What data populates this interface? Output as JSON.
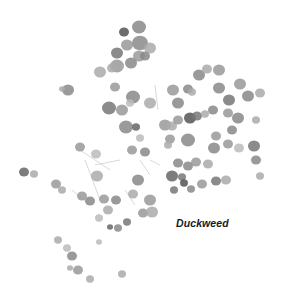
{
  "label": {
    "text": "Duckweed",
    "color": "#1a1a1a"
  },
  "background": "#ffffff",
  "fronds": [
    [
      139,
      27,
      7,
      "#888"
    ],
    [
      124,
      32,
      5,
      "#555"
    ],
    [
      140,
      43,
      8,
      "#8a8a8a"
    ],
    [
      127,
      45,
      6,
      "#999"
    ],
    [
      150,
      48,
      6,
      "#aaa"
    ],
    [
      117,
      53,
      6,
      "#777"
    ],
    [
      139,
      56,
      6,
      "#9a9a9a"
    ],
    [
      145,
      56,
      5,
      "#888"
    ],
    [
      117,
      66,
      7,
      "#999"
    ],
    [
      131,
      63,
      6,
      "#888"
    ],
    [
      100,
      72,
      6,
      "#aaa"
    ],
    [
      112,
      68,
      5,
      "#aaa"
    ],
    [
      68,
      90,
      6,
      "#888"
    ],
    [
      62,
      89,
      3,
      "#aaa"
    ],
    [
      115,
      87,
      5,
      "#999"
    ],
    [
      133,
      97,
      7,
      "#888"
    ],
    [
      109,
      108,
      7,
      "#777"
    ],
    [
      122,
      110,
      6,
      "#999"
    ],
    [
      150,
      103,
      6,
      "#aaa"
    ],
    [
      130,
      103,
      4,
      "#bbb"
    ],
    [
      126,
      127,
      7,
      "#888"
    ],
    [
      136,
      127,
      4,
      "#666"
    ],
    [
      165,
      125,
      6,
      "#999"
    ],
    [
      172,
      126,
      5,
      "#aaa"
    ],
    [
      140,
      138,
      4,
      "#bbb"
    ],
    [
      173,
      90,
      6,
      "#999"
    ],
    [
      188,
      89,
      5,
      "#888"
    ],
    [
      192,
      92,
      4,
      "#aaa"
    ],
    [
      178,
      103,
      6,
      "#888"
    ],
    [
      190,
      118,
      6,
      "#555"
    ],
    [
      197,
      116,
      5,
      "#777"
    ],
    [
      178,
      120,
      5,
      "#999"
    ],
    [
      205,
      114,
      4,
      "#aaa"
    ],
    [
      188,
      140,
      7,
      "#888"
    ],
    [
      170,
      139,
      5,
      "#999"
    ],
    [
      199,
      75,
      6,
      "#888"
    ],
    [
      219,
      70,
      6,
      "#999"
    ],
    [
      207,
      69,
      5,
      "#aaa"
    ],
    [
      219,
      88,
      6,
      "#888"
    ],
    [
      229,
      100,
      6,
      "#777"
    ],
    [
      240,
      84,
      6,
      "#999"
    ],
    [
      248,
      96,
      6,
      "#888"
    ],
    [
      260,
      93,
      5,
      "#aaa"
    ],
    [
      213,
      110,
      5,
      "#888"
    ],
    [
      228,
      113,
      5,
      "#999"
    ],
    [
      238,
      118,
      6,
      "#888"
    ],
    [
      256,
      120,
      4,
      "#aaa"
    ],
    [
      232,
      130,
      5,
      "#888"
    ],
    [
      216,
      136,
      5,
      "#999"
    ],
    [
      254,
      146,
      6,
      "#777"
    ],
    [
      214,
      148,
      6,
      "#888"
    ],
    [
      228,
      144,
      5,
      "#999"
    ],
    [
      239,
      148,
      5,
      "#bbb"
    ],
    [
      256,
      160,
      5,
      "#888"
    ],
    [
      260,
      176,
      4,
      "#aaa"
    ],
    [
      80,
      147,
      5,
      "#999"
    ],
    [
      96,
      154,
      5,
      "#bbb"
    ],
    [
      132,
      150,
      5,
      "#999"
    ],
    [
      145,
      152,
      5,
      "#888"
    ],
    [
      168,
      145,
      4,
      "#aaa"
    ],
    [
      178,
      163,
      5,
      "#888"
    ],
    [
      172,
      176,
      6,
      "#666"
    ],
    [
      182,
      177,
      4,
      "#777"
    ],
    [
      184,
      183,
      4,
      "#555"
    ],
    [
      188,
      166,
      5,
      "#888"
    ],
    [
      196,
      162,
      5,
      "#999"
    ],
    [
      208,
      164,
      5,
      "#aaa"
    ],
    [
      216,
      181,
      5,
      "#777"
    ],
    [
      226,
      180,
      5,
      "#aaa"
    ],
    [
      202,
      184,
      5,
      "#999"
    ],
    [
      191,
      189,
      4,
      "#888"
    ],
    [
      174,
      190,
      4,
      "#777"
    ],
    [
      24,
      172,
      5,
      "#666"
    ],
    [
      34,
      174,
      4,
      "#aaa"
    ],
    [
      56,
      184,
      5,
      "#999"
    ],
    [
      62,
      190,
      4,
      "#aaa"
    ],
    [
      97,
      176,
      6,
      "#aaa"
    ],
    [
      82,
      196,
      5,
      "#999"
    ],
    [
      90,
      201,
      5,
      "#888"
    ],
    [
      104,
      199,
      5,
      "#999"
    ],
    [
      116,
      200,
      5,
      "#888"
    ],
    [
      133,
      194,
      5,
      "#aaa"
    ],
    [
      138,
      180,
      6,
      "#888"
    ],
    [
      150,
      200,
      6,
      "#999"
    ],
    [
      143,
      213,
      5,
      "#999"
    ],
    [
      152,
      212,
      6,
      "#aaa"
    ],
    [
      108,
      210,
      5,
      "#aaa"
    ],
    [
      118,
      228,
      4,
      "#888"
    ],
    [
      127,
      222,
      4,
      "#777"
    ],
    [
      99,
      218,
      4,
      "#bbb"
    ],
    [
      58,
      240,
      4,
      "#aaa"
    ],
    [
      67,
      248,
      4,
      "#bbb"
    ],
    [
      72,
      256,
      5,
      "#888"
    ],
    [
      78,
      270,
      5,
      "#999"
    ],
    [
      70,
      268,
      3,
      "#aaa"
    ],
    [
      90,
      279,
      4,
      "#aaa"
    ],
    [
      122,
      274,
      4,
      "#aaa"
    ],
    [
      99,
      242,
      3,
      "#bbb"
    ],
    [
      110,
      227,
      3,
      "#666"
    ]
  ],
  "debris": [
    [
      80,
      150,
      110,
      170
    ],
    [
      85,
      160,
      100,
      200
    ],
    [
      95,
      165,
      120,
      160
    ],
    [
      125,
      190,
      135,
      205
    ],
    [
      150,
      160,
      160,
      165
    ],
    [
      72,
      190,
      90,
      205
    ],
    [
      140,
      160,
      150,
      175
    ],
    [
      155,
      85,
      158,
      110
    ]
  ]
}
